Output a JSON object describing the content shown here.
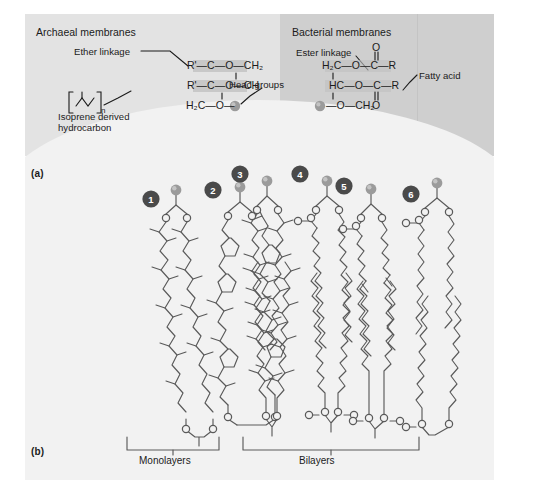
{
  "figure": {
    "panel_a_label": "(a)",
    "panel_b_label": "(b)"
  },
  "panel_a": {
    "archaeal": {
      "heading": "Archaeal membranes",
      "annotations": {
        "ether_linkage": "Ether linkage",
        "isoprene_line1": "Isoprene derived",
        "isoprene_line2": "hydrocarbon",
        "head_groups": "Head groups"
      },
      "formula": {
        "row1": "R'—C—O—CH₂",
        "row2": "R'—C—O—CH",
        "row3": "H₂C—O—",
        "bracket_subscript": "n",
        "r_prime": "R'",
        "c": "C",
        "o": "O",
        "ch2": "CH₂",
        "ch": "CH",
        "h2c": "H₂C"
      }
    },
    "bacterial": {
      "heading": "Bacterial membranes",
      "annotations": {
        "ester_linkage": "Ester linkage",
        "fatty_acid": "Fatty acid"
      },
      "formula": {
        "row1": "H₂C—O—C—R",
        "row2": "HC—O—C—R",
        "row3": "—O—CH₂",
        "h2c": "H₂C",
        "hc": "HC",
        "ch2": "CH₂",
        "o": "O",
        "c": "C",
        "r": "R"
      }
    }
  },
  "panel_b": {
    "structures": [
      {
        "number": "1",
        "type": "monolayer",
        "description": "branched isoprenoid bipolar tetraether"
      },
      {
        "number": "2",
        "type": "monolayer",
        "description": "cyclopentane-containing bipolar tetraether"
      },
      {
        "number": "3",
        "type": "monolayer",
        "description": "branched isoprenoid diether bilayer halves"
      },
      {
        "number": "4",
        "type": "bilayer",
        "description": "straight-chain fatty acid ester bilayer"
      },
      {
        "number": "5",
        "type": "bilayer",
        "description": "unsaturated fatty acid ester bilayer"
      },
      {
        "number": "6",
        "type": "bilayer",
        "description": "slanted long-chain ester bilayer"
      }
    ],
    "brackets": {
      "monolayers": "Monolayers",
      "bilayers": "Bilayers"
    }
  },
  "colors": {
    "panel_a_left_bg": "#e3e3e3",
    "panel_a_right_bg": "#cfcfcf",
    "panel_b_bg": "#f2f2f2",
    "head_group_sphere": "#9b9b9b",
    "number_badge": "#4a4a4a",
    "stroke": "#5a5a5a",
    "text": "#1b1b1b",
    "formula_highlight": "#bfbfbf"
  }
}
